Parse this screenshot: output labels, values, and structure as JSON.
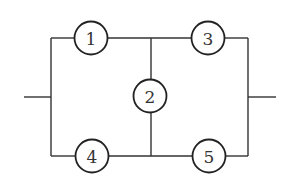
{
  "diagram": {
    "type": "bridge-network",
    "colors": {
      "line": "#333333",
      "background": "#ffffff"
    },
    "nodes": [
      {
        "id": "1",
        "label": "1",
        "cx": 91,
        "cy": 38,
        "r": 16.5
      },
      {
        "id": "2",
        "label": "2",
        "cx": 150,
        "cy": 96,
        "r": 16.5
      },
      {
        "id": "3",
        "label": "3",
        "cx": 208,
        "cy": 38,
        "r": 16.5
      },
      {
        "id": "4",
        "label": "4",
        "cx": 92,
        "cy": 156,
        "r": 16.5
      },
      {
        "id": "5",
        "label": "5",
        "cx": 209,
        "cy": 156,
        "r": 16.5
      }
    ],
    "wires": [
      {
        "name": "input-terminal",
        "x1": 24,
        "y1": 97,
        "x2": 51,
        "y2": 97
      },
      {
        "name": "left-rail",
        "x1": 51,
        "y1": 38,
        "x2": 51,
        "y2": 156
      },
      {
        "name": "top-left-to-1",
        "x1": 51,
        "y1": 38,
        "x2": 74.5,
        "y2": 38
      },
      {
        "name": "1-to-junction",
        "x1": 107.5,
        "y1": 38,
        "x2": 191.5,
        "y2": 38
      },
      {
        "name": "3-to-right",
        "x1": 224.5,
        "y1": 38,
        "x2": 248,
        "y2": 38
      },
      {
        "name": "bottom-left-to-4",
        "x1": 51,
        "y1": 156,
        "x2": 75.5,
        "y2": 156
      },
      {
        "name": "4-to-junction",
        "x1": 108.5,
        "y1": 156,
        "x2": 192.5,
        "y2": 156
      },
      {
        "name": "5-to-right",
        "x1": 225.5,
        "y1": 156,
        "x2": 248,
        "y2": 156
      },
      {
        "name": "bridge-top",
        "x1": 151,
        "y1": 38,
        "x2": 151,
        "y2": 79.5
      },
      {
        "name": "bridge-bottom",
        "x1": 151,
        "y1": 112.5,
        "x2": 151,
        "y2": 156
      },
      {
        "name": "right-rail",
        "x1": 248,
        "y1": 38,
        "x2": 248,
        "y2": 156
      },
      {
        "name": "output-terminal",
        "x1": 248,
        "y1": 97,
        "x2": 276,
        "y2": 97
      }
    ]
  }
}
